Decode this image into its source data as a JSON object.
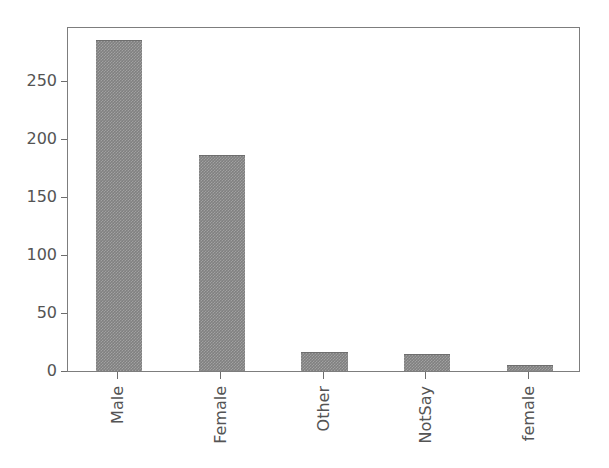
{
  "chart_data": {
    "type": "bar",
    "title": "",
    "subtitle": "",
    "xlabel": "",
    "ylabel": "",
    "categories": [
      "Male",
      "Female",
      "Other",
      "NotSay",
      "female"
    ],
    "values": [
      285,
      186,
      16,
      15,
      5
    ],
    "series": [
      {
        "name": "count",
        "values": [
          285,
          186,
          16,
          15,
          5
        ]
      }
    ],
    "ylim": [
      0,
      297
    ],
    "xlim": [
      -0.5,
      4.5
    ],
    "ytick_labels": [
      "0",
      "50",
      "100",
      "150",
      "200",
      "250"
    ],
    "ytick_values": [
      0,
      50,
      100,
      150,
      200,
      250
    ],
    "xtick_labels": [
      "Male",
      "Female",
      "Other",
      "NotSay",
      "female"
    ],
    "xtick_label_rotation": 90,
    "grid": false,
    "legend": false,
    "legend_position": "none",
    "bar_color": "#808080",
    "bar_edge_color": "#6e6e6e",
    "axis_color": "#7d7d7d",
    "tick_label_color": "#545454",
    "background_color": "#ffffff"
  }
}
